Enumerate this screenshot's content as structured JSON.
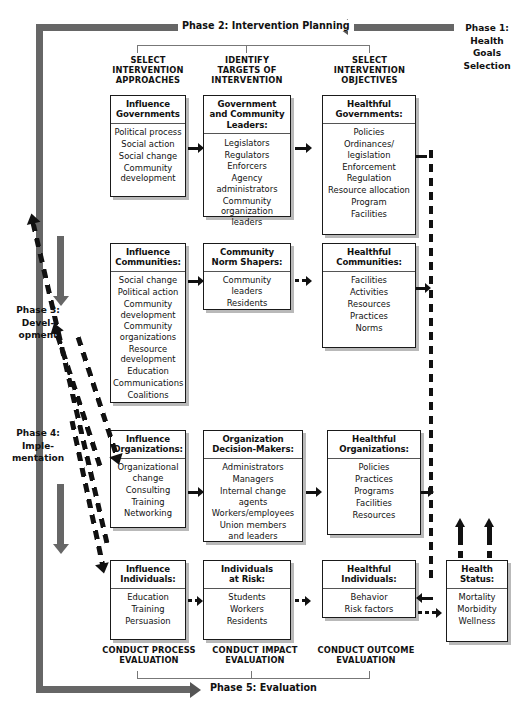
{
  "phases": {
    "phase1": "Phase 1:\nHealth\nGoals\nSelection",
    "phase2": "Phase 2: Intervention Planning",
    "phase3": "Phase 3:\nDevel-\nopment",
    "phase4": "Phase 4:\nImple-\nmentation",
    "phase5": "Phase 5: Evaluation"
  },
  "column_captions": [
    "SELECT\nINTERVENTION\nAPPROACHES",
    "IDENTIFY\nTARGETS OF\nINTERVENTION",
    "SELECT\nINTERVENTION\nOBJECTIVES"
  ],
  "bottom_captions": [
    "CONDUCT PROCESS\nEVALUATION",
    "CONDUCT IMPACT\nEVALUATION",
    "CONDUCT OUTCOME\nEVALUATION"
  ],
  "rows": [
    {
      "name": "governments",
      "approach": {
        "title": "Influence\nGovernments",
        "items": [
          "Political process",
          "Social action",
          "Social change",
          "Community\ndevelopment"
        ]
      },
      "target": {
        "title": "Government\nand Community\nLeaders:",
        "items": [
          "Legislators",
          "Regulators",
          "Enforcers",
          "Agency\nadministrators",
          "Community\norganization leaders"
        ]
      },
      "objective": {
        "title": "Healthful\nGovernments:",
        "items": [
          "Policies",
          "Ordinances/\nlegislation",
          "Enforcement",
          "Regulation",
          "Resource allocation",
          "Program",
          "Facilities"
        ]
      }
    },
    {
      "name": "communities",
      "approach": {
        "title": "Influence\nCommunities:",
        "items": [
          "Social change",
          "Political action",
          "Community\ndevelopment",
          "Community\norganizations",
          "Resource\ndevelopment",
          "Education",
          "Communications",
          "Coalitions"
        ]
      },
      "target": {
        "title": "Community\nNorm Shapers:",
        "items": [
          "Community\nleaders",
          "Residents"
        ]
      },
      "objective": {
        "title": "Healthful\nCommunities:",
        "items": [
          "Facilities",
          "Activities",
          "Resources",
          "Practices",
          "Norms"
        ]
      }
    },
    {
      "name": "organizations",
      "approach": {
        "title": "Influence\nOrganizations:",
        "items": [
          "Organizational\nchange",
          "Consulting",
          "Training",
          "Networking"
        ]
      },
      "target": {
        "title": "Organization\nDecision-Makers:",
        "items": [
          "Administrators",
          "Managers",
          "Internal change agents",
          "Workers/employees",
          "Union members\nand leaders"
        ]
      },
      "objective": {
        "title": "Healthful\nOrganizations:",
        "items": [
          "Policies",
          "Practices",
          "Programs",
          "Facilities",
          "Resources"
        ]
      }
    },
    {
      "name": "individuals",
      "approach": {
        "title": "Influence\nIndividuals:",
        "items": [
          "Education",
          "Training",
          "Persuasion"
        ]
      },
      "target": {
        "title": "Individuals\nat Risk:",
        "items": [
          "Students",
          "Workers",
          "Residents"
        ]
      },
      "objective": {
        "title": "Healthful\nIndividuals:",
        "items": [
          "Behavior",
          "Risk factors"
        ]
      }
    }
  ],
  "health_status": {
    "title": "Health\nStatus:",
    "items": [
      "Mortality",
      "Morbidity",
      "Wellness"
    ]
  },
  "colors": {
    "frame_gray": "#666666",
    "box_border": "#1a1a1a",
    "box_shadow": "#b9b9b9",
    "arrow_black": "#111111"
  }
}
